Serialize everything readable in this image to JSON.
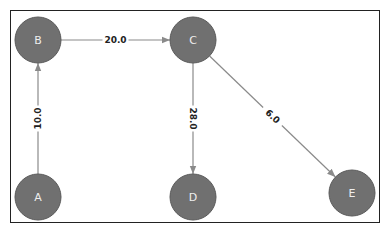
{
  "graph": {
    "colors": {
      "node_fill": "#707070",
      "node_stroke": "#5a5a5a",
      "edge": "#8a8a8a",
      "label": "#eeeeee",
      "edge_label": "#222222"
    },
    "nodes": [
      {
        "id": "A",
        "label": "A",
        "x": 38,
        "y": 197
      },
      {
        "id": "B",
        "label": "B",
        "x": 38,
        "y": 40
      },
      {
        "id": "C",
        "label": "C",
        "x": 193,
        "y": 40
      },
      {
        "id": "D",
        "label": "D",
        "x": 193,
        "y": 197
      },
      {
        "id": "E",
        "label": "E",
        "x": 352,
        "y": 193
      }
    ],
    "edges": [
      {
        "from": "A",
        "to": "B",
        "weight": "10.0"
      },
      {
        "from": "B",
        "to": "C",
        "weight": "20.0"
      },
      {
        "from": "C",
        "to": "D",
        "weight": "28.0"
      },
      {
        "from": "C",
        "to": "E",
        "weight": "6.0"
      }
    ]
  }
}
